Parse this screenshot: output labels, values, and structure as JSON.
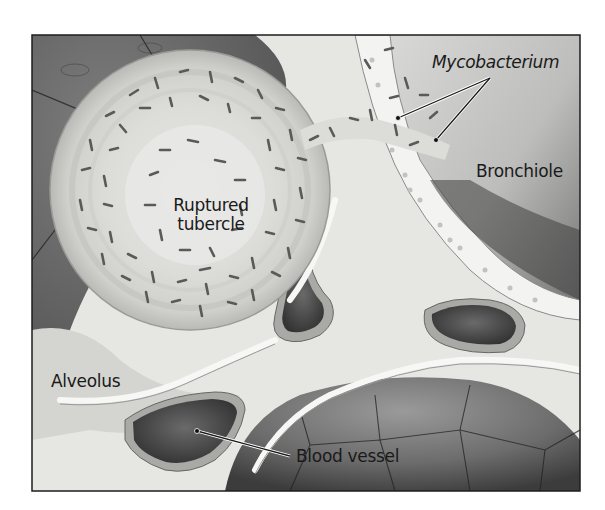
{
  "figure": {
    "type": "anatomical illustration",
    "palette": {
      "frame": "#1e1e1e",
      "alveolus_dark": "#6a6a6a",
      "alveolus_mid": "#8c8c8c",
      "tissue_light": "#e8e8e6",
      "tissue_mid": "#cfcfcc",
      "vessel_lumen": "#4a4a4a",
      "vessel_wall": "#a9a9a6",
      "bacteria": "#5a5a5a",
      "epithelium": "#f2f2f0"
    }
  },
  "labels": {
    "mycobacterium": "Mycobacterium",
    "bronchiole": "Bronchiole",
    "ruptured_tubercle_line1": "Ruptured",
    "ruptured_tubercle_line2": "tubercle",
    "alveolus": "Alveolus",
    "blood_vessel": "Blood vessel"
  }
}
